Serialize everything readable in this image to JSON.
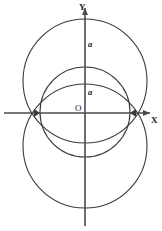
{
  "figure": {
    "background_color": "#ffffff",
    "axis_color": "#4a4a4a",
    "curve_color": "#3a3a3a",
    "origin": {
      "x": 85,
      "y": 113
    },
    "axes": {
      "x_axis": {
        "label": "X",
        "label_x": 151,
        "label_y": 116,
        "y": 113,
        "x_start": 4,
        "x_end": 150
      },
      "y_axis": {
        "label": "Y",
        "label_x": 79,
        "label_y": 3,
        "x": 85,
        "y_start": 8,
        "y_end": 226
      },
      "origin_label": {
        "text": "O",
        "x": 75,
        "y": 104
      }
    },
    "segment_labels": [
      {
        "text": "a",
        "x": 88,
        "y": 40
      },
      {
        "text": "a",
        "x": 88,
        "y": 88
      }
    ],
    "circles": [
      {
        "name": "upper-large-circle",
        "cx": 85,
        "cy": 81,
        "r": 62
      },
      {
        "name": "lower-large-circle",
        "cx": 85,
        "cy": 146,
        "r": 62
      },
      {
        "name": "inner-circle",
        "cx": 85,
        "cy": 112,
        "r": 45
      }
    ]
  },
  "chart_data": {
    "type": "scatter",
    "xlabel": "X",
    "ylabel": "Y",
    "grid": false,
    "legend": "none",
    "annotations": [
      "a",
      "a",
      "O",
      "X",
      "Y"
    ],
    "series": [
      {
        "name": "upper-large-circle",
        "kind": "circle",
        "center": [
          0,
          2
        ],
        "radius": 2
      },
      {
        "name": "lower-large-circle",
        "kind": "circle",
        "center": [
          0,
          -2
        ],
        "radius": 2
      },
      {
        "name": "inner-circle",
        "kind": "circle",
        "center": [
          0,
          0
        ],
        "radius": 1.45
      }
    ]
  }
}
